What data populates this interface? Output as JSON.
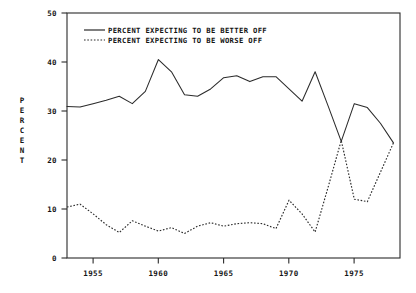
{
  "chart_data": {
    "type": "line",
    "title": "",
    "subtitle": "",
    "xlabel": "",
    "ylabel": "PERCENT",
    "xlim": [
      1953,
      1978.5
    ],
    "ylim": [
      0,
      50
    ],
    "grid": false,
    "legend_position": "top-left-inside",
    "y_ticks": [
      0,
      10,
      20,
      30,
      40,
      50
    ],
    "y_tick_labels": [
      "0",
      "10",
      "20",
      "30",
      "40",
      "50"
    ],
    "x_ticks": [
      1955,
      1960,
      1965,
      1970,
      1975
    ],
    "x_tick_labels": [
      "1955",
      "1960",
      "1965",
      "1970",
      "1975"
    ],
    "x": [
      1953,
      1954,
      1955,
      1956,
      1957,
      1958,
      1959,
      1960,
      1961,
      1962,
      1963,
      1964,
      1965,
      1966,
      1967,
      1968,
      1969,
      1970,
      1971,
      1972,
      1973,
      1974,
      1975,
      1976,
      1977,
      1978
    ],
    "series": [
      {
        "name": "PERCENT EXPECTING TO BE BETTER OFF",
        "style": "solid",
        "values": [
          30.9,
          30.8,
          31.5,
          32.2,
          33.0,
          31.5,
          34.0,
          40.5,
          38.0,
          33.3,
          33.0,
          34.5,
          36.8,
          37.2,
          36.0,
          37.0,
          37.0,
          34.5,
          32.0,
          38.0,
          31.0,
          23.8,
          31.5,
          30.7,
          27.5,
          23.5
        ]
      },
      {
        "name": "PERCENT EXPECTING TO BE WORSE OFF",
        "style": "dotted",
        "values": [
          10.4,
          11.0,
          9.0,
          6.8,
          5.2,
          7.6,
          6.5,
          5.5,
          6.2,
          5.0,
          6.5,
          7.2,
          6.5,
          7.0,
          7.2,
          7.0,
          6.0,
          11.8,
          9.0,
          5.3,
          14.5,
          24.0,
          12.0,
          11.5,
          17.5,
          23.5
        ]
      }
    ]
  },
  "axis": {
    "y_label_letters": [
      "P",
      "E",
      "R",
      "C",
      "E",
      "N",
      "T"
    ]
  },
  "legend": {
    "items": [
      {
        "label": "PERCENT EXPECTING TO BE BETTER OFF",
        "style": "solid"
      },
      {
        "label": "PERCENT EXPECTING TO BE WORSE OFF",
        "style": "dotted"
      }
    ]
  },
  "colors": {
    "ink": "#2b2b2b",
    "background": "#ffffff"
  }
}
